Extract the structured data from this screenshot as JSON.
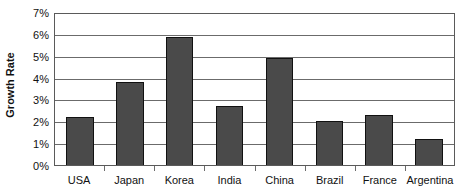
{
  "chart_data": {
    "type": "bar",
    "title": "",
    "subtitle": "",
    "xlabel": "",
    "ylabel": "Growth Rate",
    "categories": [
      "USA",
      "Japan",
      "Korea",
      "India",
      "China",
      "Brazil",
      "France",
      "Argentina"
    ],
    "values": [
      2.2,
      3.8,
      5.85,
      2.7,
      4.9,
      2.0,
      2.3,
      1.2
    ],
    "series": [
      {
        "name": "Growth Rate",
        "values": [
          2.2,
          3.8,
          5.85,
          2.7,
          4.9,
          2.0,
          2.3,
          1.2
        ]
      }
    ],
    "ylim": [
      0,
      7
    ],
    "ytick_values": [
      0,
      1,
      2,
      3,
      4,
      5,
      6,
      7
    ],
    "ytick_labels": [
      "0%",
      "1%",
      "2%",
      "3%",
      "4%",
      "5%",
      "6%",
      "7%"
    ],
    "grid": true,
    "grid_axis": "y",
    "legend": false,
    "legend_position": "none",
    "bar_color": "#4a4a4a",
    "bar_border_color": "#111111",
    "grid_color": "#6b6b6b",
    "axis_color": "#5a5a5a",
    "background_color": "#ffffff",
    "text_color": "#111111",
    "value_unit": "%"
  }
}
